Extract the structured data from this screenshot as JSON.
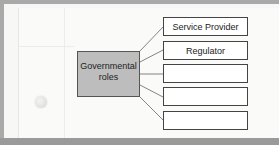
{
  "diagram": {
    "center": {
      "line1": "Governmental",
      "line2": "roles"
    },
    "roles": [
      {
        "label": "Service Provider"
      },
      {
        "label": "Regulator"
      },
      {
        "label": ""
      },
      {
        "label": ""
      },
      {
        "label": ""
      }
    ]
  },
  "colors": {
    "center_fill": "#bdbdbd",
    "box_border": "#444444",
    "frame": "#a9a9a9",
    "paper": "#fafaf8"
  }
}
